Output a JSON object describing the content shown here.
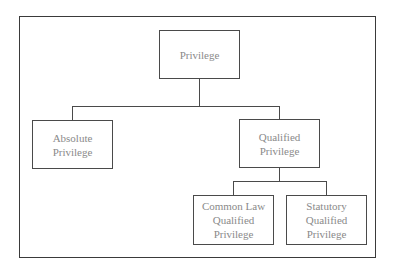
{
  "diagram": {
    "type": "hierarchy",
    "root": {
      "label": "Privilege",
      "children": [
        {
          "label": "Absolute\nPrivilege"
        },
        {
          "label": "Qualified\nPrivilege",
          "children": [
            {
              "label": "Common Law\nQualified\nPrivilege"
            },
            {
              "label": "Statutory\nQualified\nPrivilege"
            }
          ]
        }
      ]
    }
  },
  "nodes": {
    "privilege": "Privilege",
    "absolute": "Absolute\nPrivilege",
    "qualified": "Qualified\nPrivilege",
    "common_law": "Common Law\nQualified\nPrivilege",
    "statutory": "Statutory\nQualified\nPrivilege"
  },
  "colors": {
    "border": "#4a4a4a",
    "text": "#8a8a8a",
    "background": "#ffffff"
  }
}
